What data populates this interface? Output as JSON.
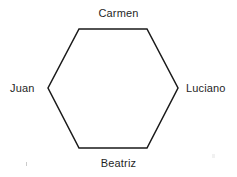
{
  "diagram": {
    "type": "hexagon-network",
    "shape_name": "hexagon",
    "background_color": "#ffffff",
    "stroke_color": "#1a1a1a",
    "stroke_width": 1.5,
    "text_color": "#1f1f1f",
    "vertices": [
      {
        "x": 79,
        "y": 29
      },
      {
        "x": 147,
        "y": 29
      },
      {
        "x": 178,
        "y": 88
      },
      {
        "x": 147,
        "y": 148
      },
      {
        "x": 79,
        "y": 148
      },
      {
        "x": 48,
        "y": 88
      }
    ],
    "polygon_points": "79,29 147,29 178,88 147,148 79,148 48,88",
    "labels": {
      "top": "Carmen",
      "right": "Luciano",
      "bottom": "Beatriz",
      "left": "Juan"
    }
  }
}
